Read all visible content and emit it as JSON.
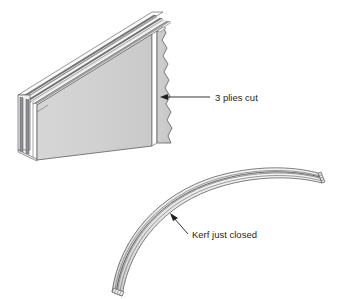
{
  "figure": {
    "background_color": "#ffffff",
    "width": 342,
    "height": 299
  },
  "colors": {
    "panel_face": "#d2d2d2",
    "panel_face_shadow": "#c4c4c4",
    "ply_light": "#f2f2f2",
    "ply_dark": "#6e6e6e",
    "ply_mid": "#a8a8a8",
    "outline": "#58595b",
    "label_text": "#231f20",
    "leader_line": "#231f20",
    "kerf_gap": "#ffffff"
  },
  "annotations": [
    {
      "id": "plies-cut",
      "text": "3 plies cut",
      "text_x": 215,
      "text_y": 100,
      "leader_start_x": 210,
      "leader_start_y": 97,
      "leader_end_x": 163,
      "leader_end_y": 97,
      "arrow_direction": "left",
      "describes": "saw kerf slicing through three plies of the flat plywood panel"
    },
    {
      "id": "kerf-just-closed",
      "text": "Kerf just closed",
      "text_x": 192,
      "text_y": 238,
      "leader_start_x": 188,
      "leader_start_y": 234,
      "leader_end_x": 171,
      "leader_end_y": 215,
      "arrow_direction": "up-left",
      "describes": "kerf line on the bent plywood where the saw cut has pinched shut"
    }
  ],
  "objects": {
    "flat_panel": {
      "name": "flat plywood panel with saw kerf",
      "ply_count": 5,
      "cut_plies": 3,
      "has_torn_edge": true,
      "torn_edge_side": "right",
      "kerf_orientation": "vertical",
      "view": "isometric"
    },
    "curved_piece": {
      "name": "bent plywood strip with closed kerf",
      "shape": "arc",
      "layer_lines": 4,
      "view": "isometric"
    }
  }
}
